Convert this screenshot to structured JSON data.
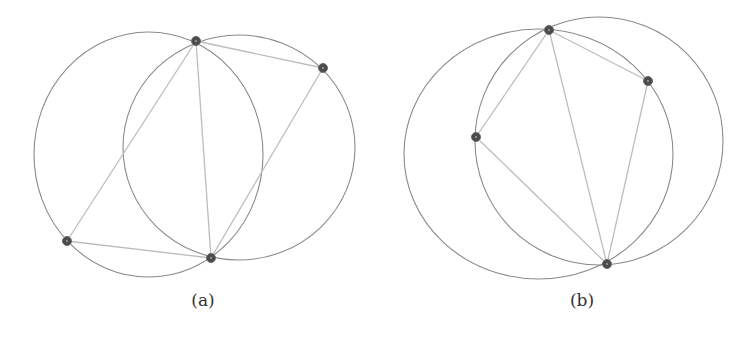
{
  "colors": {
    "circle_stroke": "#8a8a8a",
    "chord_stroke": "#bdbdbd",
    "vertex_fill": "#4a4a4a",
    "background": "#ffffff"
  },
  "panels": [
    {
      "id": "a",
      "caption": "(a)",
      "caption_pos": {
        "x": 203,
        "y": 290
      },
      "circles": [
        {
          "cx": 148.5,
          "cy": 154.5,
          "rx": 114.5,
          "ry": 122.5
        },
        {
          "cx": 239,
          "cy": 147.5,
          "rx": 116,
          "ry": 112.5
        }
      ],
      "points": [
        {
          "x": 196,
          "y": 41
        },
        {
          "x": 323,
          "y": 68
        },
        {
          "x": 67,
          "y": 241
        },
        {
          "x": 211,
          "y": 258
        }
      ],
      "segments": [
        [
          0,
          1
        ],
        [
          0,
          2
        ],
        [
          0,
          3
        ],
        [
          1,
          3
        ],
        [
          2,
          3
        ]
      ]
    },
    {
      "id": "b",
      "caption": "(b)",
      "caption_pos": {
        "x": 582,
        "y": 290
      },
      "circles": [
        {
          "cx": 538.5,
          "cy": 154,
          "rx": 134.5,
          "ry": 125
        },
        {
          "cx": 599,
          "cy": 141,
          "rx": 124,
          "ry": 124
        }
      ],
      "points": [
        {
          "x": 549,
          "y": 30
        },
        {
          "x": 648,
          "y": 81
        },
        {
          "x": 476,
          "y": 137
        },
        {
          "x": 607,
          "y": 264
        }
      ],
      "segments": [
        [
          0,
          1
        ],
        [
          0,
          2
        ],
        [
          0,
          3
        ],
        [
          1,
          3
        ],
        [
          2,
          3
        ]
      ]
    }
  ]
}
